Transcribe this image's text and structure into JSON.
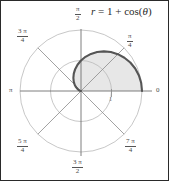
{
  "figure": {
    "title": "r = 1 + cos(θ)",
    "title_parts": {
      "r": "r",
      "equals": " = 1 + ",
      "cos": "cos(",
      "theta": "θ",
      "close": ")"
    },
    "background_color": "#ffffff",
    "border_color": "#2a2a2a"
  },
  "axis_labels": {
    "right": "0",
    "left": "π",
    "top_num": "π",
    "top_den": "2",
    "bottom_num": "3 π",
    "bottom_den": "2",
    "upper_right_num": "π",
    "upper_right_den": "4",
    "upper_left_num": "3 π",
    "upper_left_den": "4",
    "lower_left_num": "5 π",
    "lower_left_den": "4",
    "lower_right_num": "7 π",
    "lower_right_den": "4",
    "radial_tick": "1"
  },
  "colors": {
    "grid": "#b9b9b9",
    "axis": "#6f6f6f",
    "curve": "#555555",
    "fill": "#e6e6e6",
    "text": "#4a4a4a"
  },
  "chart_data": {
    "type": "line",
    "coordinate_system": "polar",
    "title": "r = 1 + cos(θ)",
    "equation": "r = 1 + cos(theta)",
    "curve_name": "cardioid",
    "theta_range_radians": [
      0,
      3.141592653589793
    ],
    "theta_range_label": [
      "0",
      "π"
    ],
    "r_max": 2,
    "r_min": 0,
    "rlim": [
      0,
      2
    ],
    "grid": true,
    "legend": false,
    "shaded_region": {
      "enabled": true,
      "description": "area under upper half of cardioid from theta=0 to theta=pi",
      "fill_color": "#e6e6e6"
    },
    "grid_circles_r": [
      1,
      2
    ],
    "angle_spokes_radians": [
      0,
      0.7853981633974483,
      1.5707963267948966,
      2.356194490192345,
      3.141592653589793,
      3.9269908169872414,
      4.71238898038469,
      5.497787143782138
    ],
    "angle_tick_labels": [
      "0",
      "π/4",
      "π/2",
      "3π/4",
      "π",
      "5π/4",
      "3π/2",
      "7π/4"
    ],
    "radial_tick_labels": [
      "1"
    ],
    "theta": [
      0,
      0.1308996938995747,
      0.2617993877991494,
      0.39269908169872414,
      0.5235987755982988,
      0.6544984694978736,
      0.7853981633974483,
      0.916297857297023,
      1.0471975511965976,
      1.1780972450961724,
      1.3089969389957472,
      1.439896632895322,
      1.5707963267948966,
      1.7016960206944713,
      1.832595714594046,
      1.9634954084936207,
      2.0943951023931953,
      2.2252947962927703,
      2.356194490192345,
      2.4870941840919194,
      2.6179938779914944,
      2.748893571891069,
      2.8797932657906435,
      3.0106929596902186,
      3.141592653589793
    ],
    "r": [
      2.0,
      1.9914,
      1.9659,
      1.9239,
      1.866,
      1.7934,
      1.7071,
      1.6088,
      1.5,
      1.3827,
      1.2588,
      1.1305,
      1.0,
      0.8695,
      0.7412,
      0.6173,
      0.5,
      0.3912,
      0.2929,
      0.2066,
      0.134,
      0.0761,
      0.0341,
      0.0086,
      0.0
    ],
    "xy_points": [
      [
        2.0,
        0.0
      ],
      [
        1.9744,
        0.26
      ],
      [
        1.8988,
        0.5088
      ],
      [
        1.7769,
        0.7357
      ],
      [
        1.6161,
        0.9319
      ],
      [
        1.4266,
        1.0897
      ],
      [
        1.2071,
        1.2071
      ],
      [
        0.9804,
        1.2768
      ],
      [
        0.75,
        1.299
      ],
      [
        0.5279,
        1.2795
      ],
      [
        0.3256,
        1.2159
      ],
      [
        0.1516,
        1.1203
      ],
      [
        0.0,
        1.0
      ],
      [
        -0.1031,
        0.8634
      ],
      [
        -0.1971,
        0.7145
      ],
      [
        -0.2361,
        0.5703
      ],
      [
        -0.25,
        0.433
      ],
      [
        -0.2417,
        0.3073
      ],
      [
        -0.2071,
        0.2071
      ],
      [
        -0.1599,
        0.1306
      ],
      [
        -0.1161,
        0.067
      ],
      [
        -0.0714,
        0.0294
      ],
      [
        -0.0328,
        0.0093
      ],
      [
        -0.0085,
        0.0011
      ],
      [
        0.0,
        0.0
      ]
    ]
  }
}
